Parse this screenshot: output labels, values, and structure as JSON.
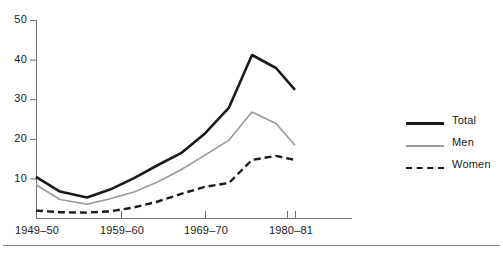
{
  "chart_data": {
    "type": "line",
    "title": "",
    "subtitle": "",
    "xlabel": "",
    "ylabel": "",
    "ylim": [
      0,
      50
    ],
    "yticks": [
      10,
      20,
      30,
      40,
      50
    ],
    "xticks": [
      "1949-50",
      "1959-60",
      "1969-70",
      "1980-81"
    ],
    "xtick_positions": [
      36,
      121,
      205,
      287
    ],
    "extra_xtick_position": 295,
    "grid": false,
    "legend_position": "right",
    "axis_style": "left-and-bottom-spines",
    "x": [
      1949,
      1952,
      1955,
      1958,
      1961,
      1964,
      1967,
      1970,
      1973,
      1976,
      1979,
      1981
    ],
    "x_pixels": [
      36,
      60,
      87,
      110,
      134,
      158,
      181,
      205,
      229,
      252,
      276,
      295
    ],
    "series": [
      {
        "name": "Total",
        "style": "solid",
        "color": "#1a1a1a",
        "width": 2.6,
        "values": [
          10.5,
          6.8,
          5.3,
          7.3,
          10.2,
          13.5,
          16.5,
          21.5,
          28.0,
          41.3,
          38.0,
          32.5
        ]
      },
      {
        "name": "Men",
        "style": "solid",
        "color": "#9a9a9a",
        "width": 1.6,
        "values": [
          8.5,
          4.8,
          3.6,
          5.0,
          6.7,
          9.3,
          12.3,
          16.0,
          19.8,
          26.9,
          24.0,
          18.5
        ]
      },
      {
        "name": "Women",
        "style": "dashed",
        "color": "#1a1a1a",
        "width": 2.4,
        "values": [
          2.0,
          1.6,
          1.5,
          1.8,
          2.8,
          4.3,
          6.2,
          8.0,
          9.0,
          14.8,
          15.8,
          14.8
        ]
      }
    ]
  },
  "legend": {
    "items": [
      {
        "label": "Total",
        "swatch": "solid-thick-black-line"
      },
      {
        "label": "Men",
        "swatch": "solid-thin-gray-line"
      },
      {
        "label": "Women",
        "swatch": "dashed-black-line"
      }
    ]
  },
  "colors": {
    "total": "#1a1a1a",
    "men": "#9a9a9a",
    "women": "#1a1a1a",
    "axis": "#6f6f6f",
    "text": "#1a1a1a",
    "rule": "#8d8d8d",
    "background": "#ffffff"
  },
  "axes": {
    "y_tick_labels": [
      "50",
      "40",
      "30",
      "20",
      "10"
    ],
    "x_tick_labels": [
      "1949–50",
      "1959–60",
      "1969–70",
      "1980–81"
    ]
  }
}
